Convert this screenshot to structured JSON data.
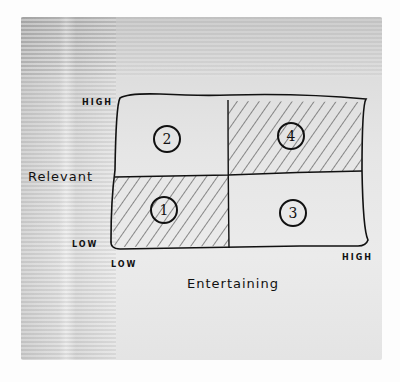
{
  "diagram": {
    "type": "2x2 matrix sketch on napkin",
    "y_axis": {
      "label": "Relevant",
      "high_label": "HIGH",
      "low_label": "LOW"
    },
    "x_axis": {
      "label": "Entertaining",
      "high_label": "HIGH",
      "low_label": "LOW"
    },
    "quadrants": [
      {
        "position": "bottom-left",
        "number": "1",
        "relevant": "low",
        "entertaining": "low",
        "shaded": true
      },
      {
        "position": "top-left",
        "number": "2",
        "relevant": "high",
        "entertaining": "low",
        "shaded": false
      },
      {
        "position": "bottom-right",
        "number": "3",
        "relevant": "low",
        "entertaining": "high",
        "shaded": false
      },
      {
        "position": "top-right",
        "number": "4",
        "relevant": "high",
        "entertaining": "high",
        "shaded": true
      }
    ],
    "colors": {
      "ink": "#111111",
      "hatch": "#444444",
      "napkin": "#e4e4e4",
      "background": "#fdfdfd"
    }
  }
}
